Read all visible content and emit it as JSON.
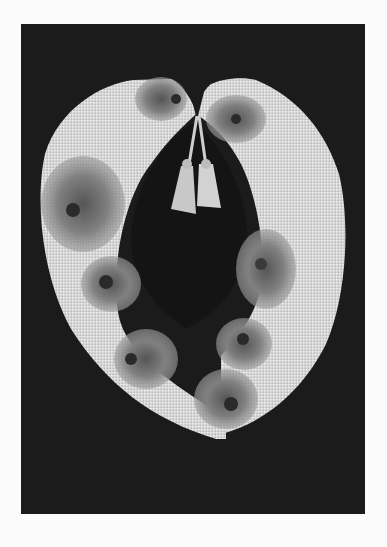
{
  "image": {
    "subject": "embroidered collar with floral motifs and tassels",
    "background_color": "#1b1b1b",
    "page_color": "#fbfbfb",
    "fabric_color": "#d8d8d8",
    "flower_color": "#7a7a7a",
    "flower_center_color": "#2a2a2a"
  }
}
